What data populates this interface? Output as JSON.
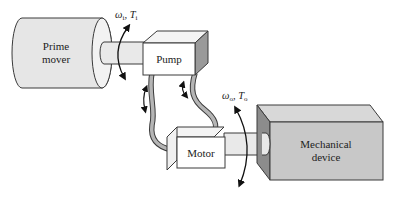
{
  "diagram": {
    "type": "hydrostatic transmission schematic",
    "components": {
      "prime_mover": {
        "label_line1": "Prime",
        "label_line2": "mover"
      },
      "pump": {
        "label": "Pump"
      },
      "motor": {
        "label": "Motor"
      },
      "mechanical_device": {
        "label_line1": "Mechanical",
        "label_line2": "device"
      }
    },
    "input_shaft": {
      "omega_symbol": "ω",
      "omega_subscript": "i",
      "separator": ", ",
      "torque_symbol": "T",
      "torque_subscript": "i"
    },
    "output_shaft": {
      "omega_symbol": "ω",
      "omega_subscript": "o",
      "separator": ", ",
      "torque_symbol": "T",
      "torque_subscript": "o"
    },
    "colors": {
      "outline": "#3a3a3a",
      "cylinder_fill": "#e6e6e6",
      "shaft_fill": "#e9e9e9",
      "box_front": "#ffffff",
      "box_top": "#f4f4f4",
      "box_side_dark": "#9a9a9a",
      "device_front": "#c8c8c8",
      "device_top": "#d8d8d8",
      "device_side": "#8c8c8c",
      "hose_fill": "#b5b5b5"
    }
  }
}
